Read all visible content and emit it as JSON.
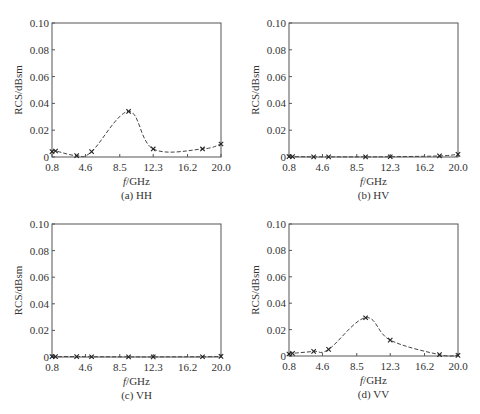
{
  "chart_data": [
    {
      "type": "line",
      "id": "a",
      "title": "(a) HH",
      "xlabel_italic": "f",
      "xlabel_rest": "/GHz",
      "ylabel": "RCS/dBsm",
      "xlim": [
        0.8,
        20.0
      ],
      "ylim": [
        0,
        0.1
      ],
      "xticks": [
        0.8,
        4.6,
        8.5,
        12.3,
        16.2,
        20.0
      ],
      "xtick_labels": [
        "0.8",
        "4.6",
        "8.5",
        "12.3",
        "16.2",
        "20.0"
      ],
      "yticks": [
        0,
        0.02,
        0.04,
        0.06,
        0.08,
        0.1
      ],
      "ytick_labels": [
        "0",
        "0.02",
        "0.04",
        "0.06",
        "0.08",
        "0.10"
      ],
      "grid": false,
      "line_style": "dashed",
      "marker": "x",
      "series": [
        {
          "name": "HH",
          "x": [
            0.8,
            1.2,
            3.6,
            5.3,
            9.5,
            12.3,
            17.9,
            20.0
          ],
          "values": [
            0.004,
            0.0045,
            0.001,
            0.004,
            0.034,
            0.006,
            0.006,
            0.0097
          ]
        }
      ]
    },
    {
      "type": "line",
      "id": "b",
      "title": "(b) HV",
      "xlabel_italic": "f",
      "xlabel_rest": "/GHz",
      "ylabel": "RCS/dBsm",
      "xlim": [
        0.8,
        20.0
      ],
      "ylim": [
        0,
        0.1
      ],
      "xticks": [
        0.8,
        4.6,
        8.5,
        12.3,
        16.2,
        20.0
      ],
      "xtick_labels": [
        "0.8",
        "4.6",
        "8.5",
        "12.3",
        "16.2",
        "20.0"
      ],
      "yticks": [
        0,
        0.02,
        0.04,
        0.06,
        0.08,
        0.1
      ],
      "ytick_labels": [
        "0",
        "0.02",
        "0.04",
        "0.06",
        "0.08",
        "0.10"
      ],
      "grid": false,
      "line_style": "dashed",
      "marker": "x",
      "series": [
        {
          "name": "HV",
          "x": [
            0.8,
            1.2,
            3.6,
            5.3,
            9.5,
            12.3,
            17.9,
            20.0
          ],
          "values": [
            0.0003,
            0.0003,
            0.0001,
            0.0001,
            0.0001,
            0.0002,
            0.0008,
            0.002
          ]
        }
      ]
    },
    {
      "type": "line",
      "id": "c",
      "title": "(c) VH",
      "xlabel_italic": "f",
      "xlabel_rest": "/GHz",
      "ylabel": "RCS/dBsm",
      "xlim": [
        0.8,
        20.0
      ],
      "ylim": [
        0,
        0.1
      ],
      "xticks": [
        0.8,
        4.6,
        8.5,
        12.3,
        16.2,
        20.0
      ],
      "xtick_labels": [
        "0.8",
        "4.6",
        "8.5",
        "12.3",
        "16.2",
        "20.0"
      ],
      "yticks": [
        0,
        0.02,
        0.04,
        0.06,
        0.08,
        0.1
      ],
      "ytick_labels": [
        "0",
        "0.02",
        "0.04",
        "0.06",
        "0.08",
        "0.10"
      ],
      "grid": false,
      "line_style": "dashed",
      "marker": "x",
      "series": [
        {
          "name": "VH",
          "x": [
            0.8,
            1.2,
            3.6,
            5.3,
            9.5,
            12.3,
            17.9,
            20.0
          ],
          "values": [
            0.0003,
            0.0003,
            0.0003,
            0.0002,
            0.0001,
            0.0001,
            0.0002,
            0.0005
          ]
        }
      ]
    },
    {
      "type": "line",
      "id": "d",
      "title": "(d) VV",
      "xlabel_italic": "f",
      "xlabel_rest": "/GHz",
      "ylabel": "RCS/dBsm",
      "xlim": [
        0.8,
        20.0
      ],
      "ylim": [
        0,
        0.1
      ],
      "xticks": [
        0.8,
        4.6,
        8.5,
        12.3,
        16.2,
        20.0
      ],
      "xtick_labels": [
        "0.8",
        "4.6",
        "8.5",
        "12.3",
        "16.2",
        "20.0"
      ],
      "yticks": [
        0,
        0.02,
        0.04,
        0.06,
        0.08,
        0.1
      ],
      "ytick_labels": [
        "0",
        "0.02",
        "0.04",
        "0.06",
        "0.08",
        "0.10"
      ],
      "grid": false,
      "line_style": "dashed",
      "marker": "x",
      "series": [
        {
          "name": "VV",
          "x": [
            0.8,
            1.2,
            3.6,
            5.3,
            9.5,
            12.3,
            17.9,
            20.0
          ],
          "values": [
            0.0015,
            0.002,
            0.0035,
            0.005,
            0.029,
            0.012,
            0.001,
            0.0005
          ]
        }
      ]
    }
  ],
  "layout": {
    "panels": [
      {
        "left": 52,
        "top": 23,
        "width": 169,
        "height": 134
      },
      {
        "left": 289,
        "top": 23,
        "width": 169,
        "height": 134
      },
      {
        "left": 52,
        "top": 224,
        "width": 169,
        "height": 133
      },
      {
        "left": 289,
        "top": 224,
        "width": 169,
        "height": 132
      }
    ],
    "colors": {
      "axis": "#555555",
      "line": "#444444",
      "text": "#333333"
    }
  }
}
